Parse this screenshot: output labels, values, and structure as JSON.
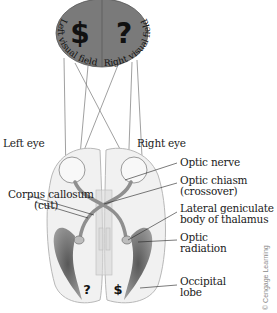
{
  "visual_field": {
    "left_field_label": "Left visual field",
    "right_field_label": "Right visual field",
    "left_symbol": "$",
    "right_symbol": "?",
    "fill_color": "#7a7a7a"
  },
  "labels": {
    "left_eye": "Left eye",
    "right_eye": "Right eye",
    "optic_nerve": "Optic nerve",
    "optic_chiasm_1": "Optic chiasm",
    "optic_chiasm_2": "(crossover)",
    "corpus_callosum_1": "Corpus callosum",
    "corpus_callosum_2": "(cut)",
    "lgn_1": "Lateral geniculate",
    "lgn_2": "body of thalamus",
    "optic_radiation_1": "Optic",
    "optic_radiation_2": "radiation",
    "occipital_lobe_1": "Occipital",
    "occipital_lobe_2": "lobe"
  },
  "occipital_symbols": {
    "left_hemisphere": "?",
    "right_hemisphere": "$"
  },
  "credit": "© Cengage Learning"
}
